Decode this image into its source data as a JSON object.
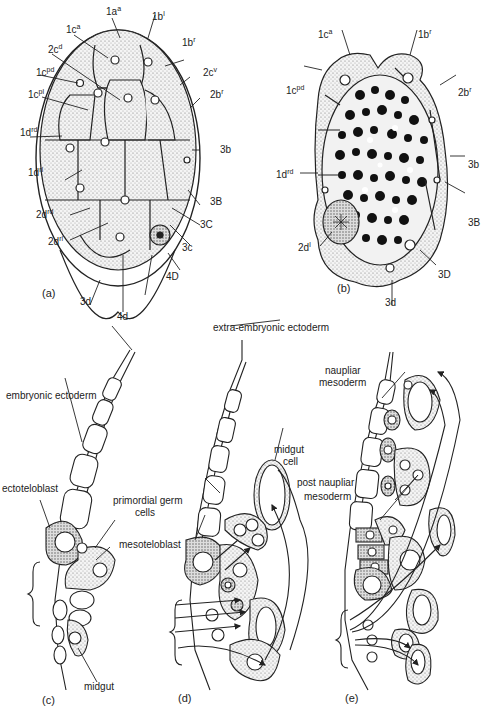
{
  "figure": {
    "panels": [
      {
        "id": "a",
        "label": "(a)",
        "description": "external view of cleaving embryo"
      },
      {
        "id": "b",
        "label": "(b)",
        "description": "section through embryo with yolk"
      },
      {
        "id": "c",
        "label": "(c)",
        "description": "germ band section, early"
      },
      {
        "id": "d",
        "label": "(d)",
        "description": "germ band section, middle"
      },
      {
        "id": "e",
        "label": "(e)",
        "description": "germ band section, late"
      }
    ],
    "panel_a_labels": [
      {
        "base": "1a",
        "sup": "a"
      },
      {
        "base": "1b",
        "sup": "l"
      },
      {
        "base": "1c",
        "sup": "a"
      },
      {
        "base": "1b",
        "sup": "r"
      },
      {
        "base": "2c",
        "sup": "d"
      },
      {
        "base": "2c",
        "sup": "v"
      },
      {
        "base": "1c",
        "sup": "pd"
      },
      {
        "base": "2b",
        "sup": "r"
      },
      {
        "base": "1c",
        "sup": "pl"
      },
      {
        "base": "1d",
        "sup": "rd"
      },
      {
        "base": "3b",
        "sup": ""
      },
      {
        "base": "1d",
        "sup": "rl"
      },
      {
        "base": "3B",
        "sup": ""
      },
      {
        "base": "2d",
        "sup": "rd"
      },
      {
        "base": "3C",
        "sup": ""
      },
      {
        "base": "2d",
        "sup": "rl"
      },
      {
        "base": "3c",
        "sup": ""
      },
      {
        "base": "4D",
        "sup": ""
      },
      {
        "base": "3d",
        "sup": ""
      },
      {
        "base": "4d",
        "sup": ""
      }
    ],
    "panel_b_labels": [
      {
        "base": "1c",
        "sup": "a"
      },
      {
        "base": "1b",
        "sup": "r"
      },
      {
        "base": "1c",
        "sup": "pd"
      },
      {
        "base": "2b",
        "sup": "r"
      },
      {
        "base": "3b",
        "sup": ""
      },
      {
        "base": "1d",
        "sup": "rd"
      },
      {
        "base": "3B",
        "sup": ""
      },
      {
        "base": "2d",
        "sup": "l"
      },
      {
        "base": "3D",
        "sup": ""
      },
      {
        "base": "3d",
        "sup": ""
      }
    ],
    "lower_labels": {
      "extra_embryonic_ectoderm": "extra-embryonic ectoderm",
      "embryonic_ectoderm": "embryonic ectoderm",
      "ectoteloblast": "ectoteloblast",
      "primordial_germ_cells_1": "primordial germ",
      "primordial_germ_cells_2": "cells",
      "mesoteloblast": "mesoteloblast",
      "midgut": "midgut",
      "midgut_cell_1": "midgut",
      "midgut_cell_2": "cell",
      "naupliar_mesoderm_1": "naupliar",
      "naupliar_mesoderm_2": "mesoderm",
      "post_naupliar_mesoderm_1": "post naupliar",
      "post_naupliar_mesoderm_2": "mesoderm"
    },
    "colors": {
      "ink": "#222222",
      "stipple": "#c8c8c8",
      "dark_stipple": "#9a9a9a",
      "yolk": "#111111",
      "background": "#ffffff"
    }
  }
}
